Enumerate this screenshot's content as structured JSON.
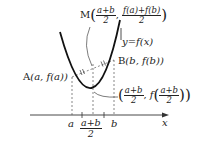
{
  "diagram": {
    "type": "convex-function-midpoint",
    "curve_label": "y=f(x)",
    "point_A": {
      "name": "A",
      "coords": "(a, f(a))"
    },
    "point_B": {
      "name": "B",
      "coords": "(b, f(b))"
    },
    "point_M": {
      "name": "M",
      "x_num": "a+b",
      "x_den": "2",
      "y_num": "f(a)+f(b)",
      "y_den": "2"
    },
    "curve_point": {
      "x_num": "a+b",
      "x_den": "2",
      "f_prefix": "f",
      "arg_num": "a+b",
      "arg_den": "2"
    },
    "axis": {
      "label": "x",
      "ticks": {
        "a": "a",
        "mid_num": "a+b",
        "mid_den": "2",
        "b": "b"
      }
    },
    "colors": {
      "ink": "#222222",
      "dashed": "#555555",
      "background": "#ffffff"
    }
  }
}
